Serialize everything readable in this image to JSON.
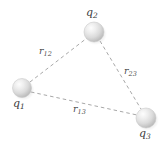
{
  "figure": {
    "type": "physics-diagram",
    "background_color": "#ffffff",
    "width": 166,
    "height": 142
  },
  "charges": [
    {
      "id": "q1",
      "symbol": "q",
      "subscript": "1",
      "center_x": 22,
      "center_y": 88,
      "radius": 9.5,
      "label_position": "below-left"
    },
    {
      "id": "q2",
      "symbol": "q",
      "subscript": "2",
      "center_x": 94,
      "center_y": 32,
      "radius": 10,
      "label_position": "above"
    },
    {
      "id": "q3",
      "symbol": "q",
      "subscript": "3",
      "center_x": 146,
      "center_y": 118,
      "radius": 10,
      "label_position": "below"
    }
  ],
  "distances": [
    {
      "id": "r12",
      "symbol": "r",
      "subscript": "12",
      "from": "q1",
      "to": "q2",
      "label_x": 48,
      "label_y": 52
    },
    {
      "id": "r23",
      "symbol": "r",
      "subscript": "23",
      "from": "q2",
      "to": "q3",
      "label_x": 131,
      "label_y": 71
    },
    {
      "id": "r13",
      "symbol": "r",
      "subscript": "13",
      "from": "q1",
      "to": "q3",
      "label_x": 82,
      "label_y": 110
    }
  ],
  "style": {
    "line_color": "#a8a8a8",
    "line_dash": "3.5 3",
    "line_width": 1,
    "sphere_fill_light": "#f2f2f2",
    "sphere_fill_mid": "#d4d4d4",
    "sphere_fill_dark": "#b0b0b0",
    "sphere_edge": "#c6c6c6",
    "text_color": "#3b3b3b"
  }
}
